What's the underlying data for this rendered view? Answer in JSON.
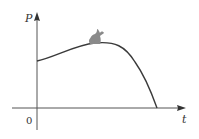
{
  "figure": {
    "y_axis_label": "P",
    "x_axis_label": "t",
    "origin_label": "0",
    "colors": {
      "axis": "#555555",
      "curve": "#3a3a3a",
      "rabbit": "#8a8a8a",
      "text": "#333333"
    },
    "curve_description": "Population P rises from positive initial value to a maximum, then falls to zero (extinction)",
    "icon": "rabbit-icon"
  }
}
